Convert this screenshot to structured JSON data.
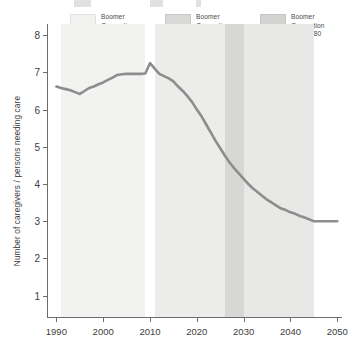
{
  "legend": {
    "entries": [
      {
        "label": "Boomer\nGeneration\nturning 45",
        "color": "#f2f2f0"
      },
      {
        "label": "Boomer\nGeneration\nturning 65",
        "color": "#d8d8d6"
      },
      {
        "label": "Boomer\nGeneration\nturning 80",
        "color": "#d3d3d1"
      }
    ]
  },
  "chart_data": {
    "type": "line",
    "title": "",
    "xlabel": "",
    "ylabel": "Number of caregivers / persons needing care",
    "xlim": [
      1988,
      2051
    ],
    "ylim": [
      0.4,
      8.3
    ],
    "grid": false,
    "legend_position": "top",
    "x_ticks": [
      1990,
      2000,
      2010,
      2020,
      2030,
      2040,
      2050
    ],
    "y_ticks": [
      1,
      2,
      3,
      4,
      5,
      6,
      7,
      8
    ],
    "line_color": "#8d8d8d",
    "series": [
      {
        "name": "Caregiver support ratio",
        "x": [
          1990,
          1991,
          1992,
          1993,
          1994,
          1995,
          1996,
          1997,
          1998,
          1999,
          2000,
          2001,
          2002,
          2003,
          2004,
          2005,
          2006,
          2007,
          2008,
          2009,
          2010,
          2011,
          2012,
          2013,
          2014,
          2015,
          2016,
          2017,
          2018,
          2019,
          2020,
          2021,
          2022,
          2023,
          2024,
          2025,
          2026,
          2027,
          2028,
          2029,
          2030,
          2031,
          2032,
          2033,
          2034,
          2035,
          2036,
          2037,
          2038,
          2039,
          2040,
          2041,
          2042,
          2043,
          2044,
          2045,
          2046,
          2047,
          2048,
          2049,
          2050
        ],
        "y": [
          6.62,
          6.58,
          6.55,
          6.52,
          6.47,
          6.42,
          6.5,
          6.58,
          6.62,
          6.68,
          6.73,
          6.8,
          6.86,
          6.93,
          6.95,
          6.96,
          6.96,
          6.96,
          6.96,
          6.97,
          7.25,
          7.1,
          6.96,
          6.9,
          6.84,
          6.76,
          6.62,
          6.5,
          6.36,
          6.2,
          6.0,
          5.82,
          5.6,
          5.38,
          5.16,
          4.96,
          4.76,
          4.58,
          4.42,
          4.28,
          4.14,
          4.0,
          3.88,
          3.78,
          3.68,
          3.58,
          3.5,
          3.42,
          3.34,
          3.3,
          3.24,
          3.2,
          3.14,
          3.1,
          3.05,
          3.0,
          3.0,
          3.0,
          3.0,
          3.0,
          3.0
        ]
      }
    ],
    "bands": [
      {
        "name": "turning-45",
        "start": 1991,
        "end": 2009,
        "color": "#f2f2f0"
      },
      {
        "name": "turning-65",
        "start": 2011,
        "end": 2026,
        "color": "#ececea"
      },
      {
        "name": "turning-80",
        "start": 2026,
        "end": 2030,
        "color": "#d7d7d5"
      },
      {
        "name": "turning-80-tail",
        "start": 2030,
        "end": 2045,
        "color": "#e8e8e6"
      }
    ]
  }
}
